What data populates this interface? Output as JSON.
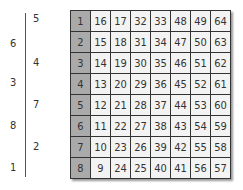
{
  "left_labels": [
    {
      "text": "5",
      "col": "right",
      "y": 14
    },
    {
      "text": "6",
      "col": "left",
      "y": 35
    },
    {
      "text": "4",
      "col": "right",
      "y": 56
    },
    {
      "text": "3",
      "col": "left",
      "y": 77
    },
    {
      "text": "7",
      "col": "right",
      "y": 98
    },
    {
      "text": "8",
      "col": "left",
      "y": 119
    },
    {
      "text": "2",
      "col": "right",
      "y": 140
    },
    {
      "text": "1",
      "col": "left",
      "y": 161
    }
  ],
  "grid": {
    "rows": [
      {
        "index": "1",
        "values": [
          "16",
          "17",
          "32",
          "33",
          "48",
          "49",
          "64"
        ]
      },
      {
        "index": "2",
        "values": [
          "15",
          "18",
          "31",
          "34",
          "47",
          "50",
          "63"
        ]
      },
      {
        "index": "3",
        "values": [
          "14",
          "19",
          "30",
          "35",
          "46",
          "51",
          "62"
        ]
      },
      {
        "index": "4",
        "values": [
          "13",
          "20",
          "29",
          "36",
          "45",
          "52",
          "61"
        ]
      },
      {
        "index": "5",
        "values": [
          "12",
          "21",
          "28",
          "37",
          "44",
          "53",
          "60"
        ]
      },
      {
        "index": "6",
        "values": [
          "11",
          "22",
          "27",
          "38",
          "43",
          "54",
          "59"
        ]
      },
      {
        "index": "7",
        "values": [
          "10",
          "23",
          "26",
          "39",
          "42",
          "55",
          "58"
        ]
      },
      {
        "index": "8",
        "values": [
          "9",
          "24",
          "25",
          "40",
          "41",
          "56",
          "57"
        ]
      }
    ]
  },
  "colors": {
    "index_column": "#aaaaaa",
    "cell": "#f3f3f3",
    "border": "#333333"
  }
}
